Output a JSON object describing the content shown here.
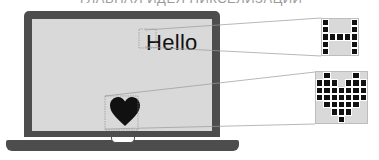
{
  "caption": "ГЛАВНАЯ ИДЕЯ ПИКСЕЛИЗАЦИИ",
  "laptop": {
    "screen_text": "Hello",
    "screen_icon": "heart-icon",
    "colors": {
      "bezel": "#4d4d4d",
      "screen": "#d9d9d9",
      "ink": "#111111"
    }
  },
  "zoomed_glyphs": [
    {
      "name": "letter-h-pixel-grid",
      "source": "H",
      "cols": 5,
      "rows": 5,
      "pixels": [
        [
          1,
          0,
          0,
          0,
          1
        ],
        [
          1,
          0,
          0,
          0,
          1
        ],
        [
          1,
          1,
          1,
          1,
          1
        ],
        [
          1,
          0,
          0,
          0,
          1
        ],
        [
          1,
          0,
          0,
          0,
          1
        ]
      ]
    },
    {
      "name": "heart-pixel-grid",
      "source": "heart",
      "cols": 7,
      "rows": 7,
      "pixels": [
        [
          0,
          1,
          0,
          0,
          0,
          1,
          0
        ],
        [
          1,
          1,
          1,
          0,
          1,
          1,
          1
        ],
        [
          1,
          1,
          1,
          1,
          1,
          1,
          1
        ],
        [
          1,
          1,
          1,
          1,
          1,
          1,
          1
        ],
        [
          0,
          1,
          1,
          1,
          1,
          1,
          0
        ],
        [
          0,
          0,
          1,
          1,
          1,
          0,
          0
        ],
        [
          0,
          0,
          0,
          1,
          0,
          0,
          0
        ]
      ]
    }
  ]
}
